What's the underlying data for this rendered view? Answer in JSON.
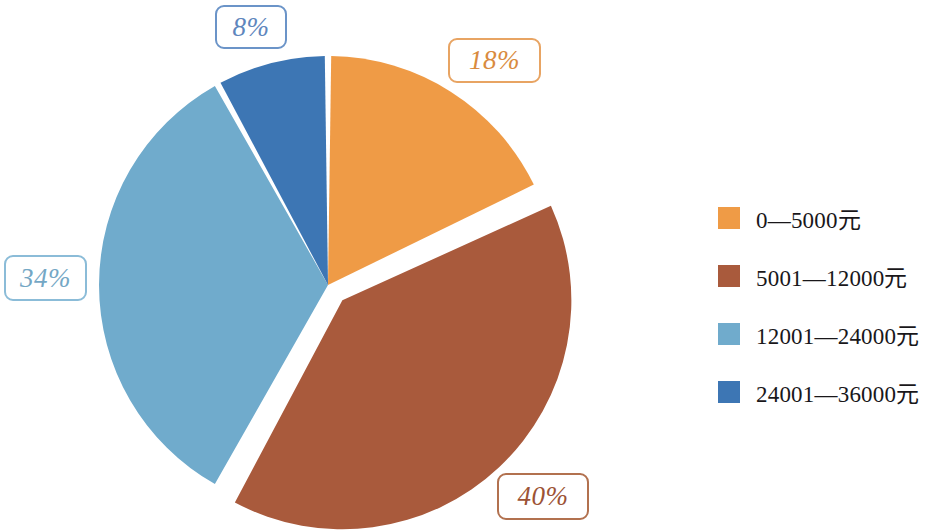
{
  "background_color": "#ffffff",
  "chart_data": {
    "type": "pie",
    "title": "",
    "subtitle": "",
    "xlabel": "",
    "ylabel": "",
    "grid": false,
    "legend_position": "right",
    "start_angle_deg": 0,
    "direction": "clockwise",
    "categories": [
      "0—5000元",
      "5001—12000元",
      "12001—24000元",
      "24001—36000元"
    ],
    "values": [
      18,
      40,
      34,
      8
    ],
    "value_unit": "%",
    "data_labels": [
      "18%",
      "40%",
      "34%",
      "8%"
    ],
    "colors": [
      "#ef9b46",
      "#a95a3c",
      "#70abcc",
      "#3d76b4"
    ],
    "exploded_slices": [
      "5001—12000元"
    ],
    "slices": [
      {
        "label": "0—5000元",
        "value": 18,
        "display": "18%",
        "color": "#ef9b46",
        "label_border_color": "#e8a463",
        "label_text_color": "#d98b3e",
        "exploded": false
      },
      {
        "label": "5001—12000元",
        "value": 40,
        "display": "40%",
        "color": "#a95a3c",
        "label_border_color": "#b2714f",
        "label_text_color": "#9c5335",
        "exploded": true
      },
      {
        "label": "12001—24000元",
        "value": 34,
        "display": "34%",
        "color": "#70abcc",
        "label_border_color": "#8bbcd8",
        "label_text_color": "#74a7c5",
        "exploded": false
      },
      {
        "label": "24001—36000元",
        "value": 8,
        "display": "8%",
        "color": "#3d76b4",
        "label_border_color": "#6b94c8",
        "label_text_color": "#5e86bd",
        "exploded": false
      }
    ]
  },
  "percent_labels": {
    "eight": "8%",
    "eighteen": "18%",
    "thirtyfour": "34%",
    "forty": "40%"
  },
  "legend": {
    "items": [
      {
        "label": "0—5000元",
        "color": "#ef9b46",
        "swatch_name": "legend-swatch-0-5000"
      },
      {
        "label": "5001—12000元",
        "color": "#a95a3c",
        "swatch_name": "legend-swatch-5001-12000"
      },
      {
        "label": "12001—24000元",
        "color": "#70abcc",
        "swatch_name": "legend-swatch-12001-24000"
      },
      {
        "label": "24001—36000元",
        "color": "#3d76b4",
        "swatch_name": "legend-swatch-24001-36000"
      }
    ]
  }
}
